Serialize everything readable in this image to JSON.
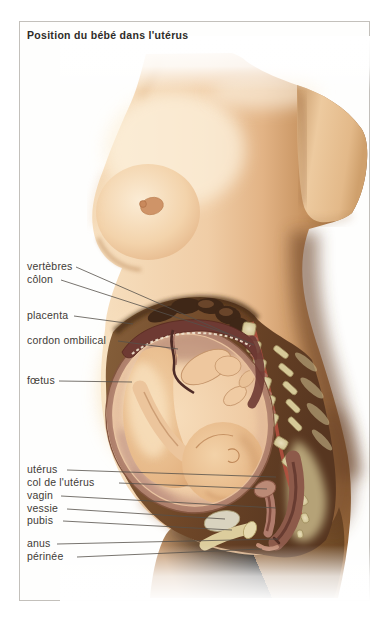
{
  "title": "Position du bébé dans l'utérus",
  "labels": [
    "vertèbres",
    "côlon",
    "placenta",
    "cordon ombilical",
    "fœtus",
    "utérus",
    "col de l'utérus",
    "vagin",
    "vessie",
    "pubis",
    "anus",
    "périnée"
  ],
  "colors": {
    "card_border": "#c3c0bb",
    "label_text": "#3f3b36",
    "leader_line": "#55504a",
    "skin": "#eec9a0",
    "cutaway_brown": "#6f4728",
    "placenta_maroon": "#6e3a33",
    "bone_cream": "#dbcfa0",
    "uterus_wall": "#ad7e6a"
  }
}
